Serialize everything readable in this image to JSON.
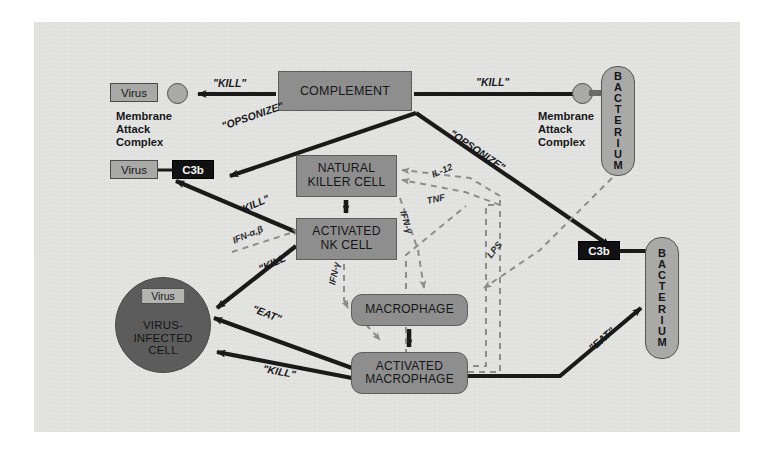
{
  "diagram": {
    "canvas_bg": "#e3e3e1",
    "node_fill": "#8e8e8e",
    "dark_fill": "#5c5c5c",
    "black_fill": "#111113",
    "light_fill": "#a9a9a7",
    "solid_arrow_color": "#1a1a1a",
    "dashed_arrow_color": "#8d8d8d"
  },
  "nodes": {
    "complement": "COMPLEMENT",
    "natural_killer_cell": "NATURAL\nKILLER CELL",
    "natural_killer_cell_line1": "NATURAL",
    "natural_killer_cell_line2": "KILLER CELL",
    "activated_nk_line1": "ACTIVATED",
    "activated_nk_line2": "NK CELL",
    "macrophage": "MACROPHAGE",
    "activated_macrophage_line1": "ACTIVATED",
    "activated_macrophage_line2": "MACROPHAGE",
    "virus_left_top": "Virus",
    "virus_left_mid": "Virus",
    "virus_in_cell": "Virus",
    "virus_infected_cell_line1": "VIRUS-",
    "virus_infected_cell_line2": "INFECTED",
    "virus_infected_cell_line3": "CELL",
    "c3b_left": "C3b",
    "c3b_right": "C3b",
    "bacterium_top": "BACTERIUM",
    "bacterium_bottom": "BACTERIUM"
  },
  "captions": {
    "mac_left": "Membrane\nAttack\nComplex",
    "mac_left_l1": "Membrane",
    "mac_left_l2": "Attack",
    "mac_left_l3": "Complex",
    "mac_right_l1": "Membrane",
    "mac_right_l2": "Attack",
    "mac_right_l3": "Complex"
  },
  "edge_labels": {
    "kill_complement_virus": "\"KILL\"",
    "kill_complement_bacterium": "\"KILL\"",
    "opsonize_virus": "\"OPSONIZE\"",
    "opsonize_bacterium": "\"OPSONIZE\"",
    "kill_nk_virus_c3b": "\"KILL\"",
    "kill_ank_infectedcell": "\"KILL\"",
    "eat_macrophage_infectedcell": "\"EAT\"",
    "kill_amac_infectedcell": "\"KILL\"",
    "eat_amac_bacterium": "\"EAT\""
  },
  "cytokines": {
    "il12": "IL-12",
    "tnf": "TNF",
    "ifn_gamma": "IFN-γ",
    "ifn_gamma_2": "IFN-γ",
    "ifn_alpha_beta": "IFN-α,β",
    "lps": "LPS"
  }
}
